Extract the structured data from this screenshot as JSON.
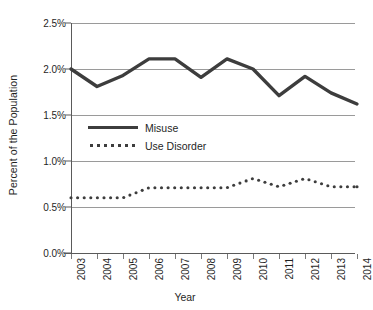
{
  "chart_data": {
    "type": "line",
    "title": "",
    "xlabel": "Year",
    "ylabel": "Percent of the Population",
    "categories": [
      "2003",
      "2004",
      "2005",
      "2006",
      "2007",
      "2008",
      "2009",
      "2010",
      "2011",
      "2012",
      "2013",
      "2014"
    ],
    "x": [
      2003,
      2004,
      2005,
      2006,
      2007,
      2008,
      2009,
      2010,
      2011,
      2012,
      2013,
      2014
    ],
    "ylim": [
      0.0,
      2.5
    ],
    "ytick_labels": [
      "0.0%",
      "0.5%",
      "1.0%",
      "1.5%",
      "2.0%",
      "2.5%"
    ],
    "ytick_values": [
      0.0,
      0.5,
      1.0,
      1.5,
      2.0,
      2.5
    ],
    "grid": true,
    "legend_position": "inside-upper-left",
    "series": [
      {
        "name": "Misuse",
        "style": "solid",
        "color": "#3d3d3d",
        "values": [
          2.0,
          1.81,
          1.93,
          2.11,
          2.11,
          1.91,
          2.11,
          2.0,
          1.71,
          1.92,
          1.74,
          1.62
        ]
      },
      {
        "name": "Use Disorder",
        "style": "dotted",
        "color": "#3d3d3d",
        "values": [
          0.6,
          0.6,
          0.6,
          0.71,
          0.71,
          0.71,
          0.71,
          0.81,
          0.72,
          0.81,
          0.72,
          0.72
        ]
      }
    ]
  },
  "axes": {
    "y_title": "Percent of the Population",
    "x_title": "Year"
  },
  "legend": {
    "entries": [
      {
        "label": "Misuse",
        "style": "solid"
      },
      {
        "label": "Use Disorder",
        "style": "dotted"
      }
    ]
  }
}
